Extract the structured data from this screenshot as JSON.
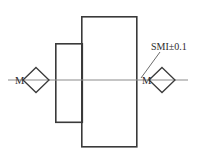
{
  "diagram": {
    "background_color": "#ffffff",
    "line_color": "#3a3a3a",
    "axis_color": "#8c8c8c",
    "leader_color": "#6b6b6b",
    "text_color": "#2b2b2b",
    "labels": {
      "left_mark": "M",
      "right_mark": "M",
      "callout": "SMI±0.1"
    },
    "annotations": {
      "callout_value": "SMI±0.1",
      "tolerance": "±0.1",
      "symbol": "SMI"
    },
    "shapes": {
      "large_rectangle": {
        "x": 81,
        "y": 16,
        "width": 56,
        "height": 131
      },
      "small_rectangle": {
        "x": 55,
        "y": 43,
        "width": 27,
        "height": 79
      },
      "center_axis": {
        "x1": 8,
        "y1": 80,
        "x2": 188,
        "y2": 80
      },
      "left_diamond": {
        "cx": 36,
        "cy": 80,
        "rx": 13,
        "ry": 13
      },
      "right_diamond": {
        "cx": 162,
        "cy": 80,
        "rx": 13,
        "ry": 13
      },
      "leader_line": {
        "x1": 141,
        "y1": 78,
        "x2": 160,
        "y2": 52
      }
    },
    "text_positions": {
      "left_mark": {
        "x": 16,
        "y": 83
      },
      "right_mark": {
        "x": 143,
        "y": 83
      },
      "callout": {
        "x": 152,
        "y": 50
      }
    }
  }
}
